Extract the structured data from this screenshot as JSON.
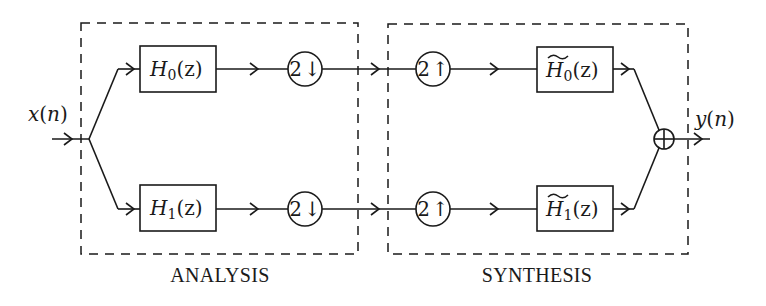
{
  "diagram": {
    "type": "two-channel filter bank (analysis / synthesis)",
    "input": {
      "label": "x(n)",
      "var": "x",
      "arg": "n"
    },
    "output": {
      "label": "y(n)",
      "var": "y",
      "arg": "n"
    },
    "sections": [
      {
        "id": "analysis",
        "caption": "ANALYSIS"
      },
      {
        "id": "synthesis",
        "caption": "SYNTHESIS"
      }
    ],
    "analysis": {
      "filters": [
        {
          "label": "H0(z)",
          "symbol": "H",
          "subscript": "0",
          "arg": "(z)",
          "tilde": false
        },
        {
          "label": "H1(z)",
          "symbol": "H",
          "subscript": "1",
          "arg": "(z)",
          "tilde": false
        }
      ],
      "downsamplers": [
        {
          "label": "2↓",
          "factor": "2",
          "direction": "↓"
        },
        {
          "label": "2↓",
          "factor": "2",
          "direction": "↓"
        }
      ]
    },
    "synthesis": {
      "upsamplers": [
        {
          "label": "2↑",
          "factor": "2",
          "direction": "↑"
        },
        {
          "label": "2↑",
          "factor": "2",
          "direction": "↑"
        }
      ],
      "filters": [
        {
          "label": "H̃0(z)",
          "symbol": "H",
          "subscript": "0",
          "arg": "(z)",
          "tilde": true
        },
        {
          "label": "H̃1(z)",
          "symbol": "H",
          "subscript": "1",
          "arg": "(z)",
          "tilde": true
        }
      ]
    },
    "adder": {
      "symbol": "⊕"
    },
    "colors": {
      "ink": "#1a1a1a",
      "background": "#ffffff"
    }
  }
}
